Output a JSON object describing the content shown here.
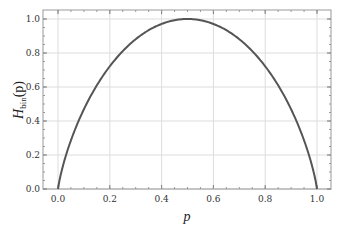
{
  "chart_data": {
    "type": "line",
    "title": "",
    "xlabel": "p",
    "ylabel": "H_bin(p)",
    "ylabel_main": "H",
    "ylabel_sub": "bin",
    "ylabel_arg": "(p)",
    "xlim": [
      0.0,
      1.0
    ],
    "ylim": [
      0.0,
      1.0
    ],
    "grid": true,
    "legend": null,
    "x_ticks": [
      "0.0",
      "0.2",
      "0.4",
      "0.6",
      "0.8",
      "1.0"
    ],
    "y_ticks": [
      "0.0",
      "0.2",
      "0.4",
      "0.6",
      "0.8",
      "1.0"
    ],
    "series": [
      {
        "name": "binary entropy",
        "color": "#555555",
        "x": [
          0.0,
          0.05,
          0.1,
          0.15,
          0.2,
          0.25,
          0.3,
          0.35,
          0.4,
          0.45,
          0.5,
          0.55,
          0.6,
          0.65,
          0.7,
          0.75,
          0.8,
          0.85,
          0.9,
          0.95,
          1.0
        ],
        "values": [
          0.0,
          0.286,
          0.469,
          0.61,
          0.722,
          0.811,
          0.881,
          0.934,
          0.971,
          0.993,
          1.0,
          0.993,
          0.971,
          0.934,
          0.881,
          0.811,
          0.722,
          0.61,
          0.469,
          0.286,
          0.0
        ]
      }
    ]
  }
}
